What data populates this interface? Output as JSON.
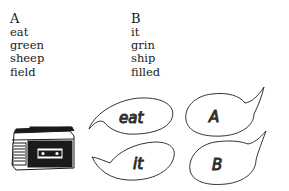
{
  "columns": [
    {
      "header": "A",
      "words": [
        "eat",
        "green",
        "sheep",
        "field"
      ]
    },
    {
      "header": "B",
      "words": [
        "it",
        "grin",
        "ship",
        "filled"
      ]
    }
  ],
  "illustration": {
    "device": "cassette-player",
    "bubbles": [
      {
        "text": "eat",
        "position": "left-top"
      },
      {
        "text": "it",
        "position": "left-bottom"
      },
      {
        "text": "A",
        "position": "right-top"
      },
      {
        "text": "B",
        "position": "right-bottom"
      }
    ]
  },
  "colors": {
    "ink": "#1a1a1a",
    "background": "#ffffff"
  }
}
